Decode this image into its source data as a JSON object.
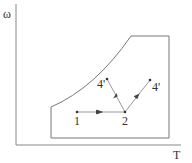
{
  "diagram": {
    "axes": {
      "y_label": "ω",
      "x_label": "T",
      "color": "#888888"
    },
    "region": {
      "description": "operating envelope",
      "color": "#777777"
    },
    "points": [
      {
        "id": "p1",
        "label": "1"
      },
      {
        "id": "p2",
        "label": "2"
      },
      {
        "id": "p4a",
        "label": "4'"
      },
      {
        "id": "p4b",
        "label": "4'"
      }
    ],
    "paths": [
      {
        "from": "1",
        "to": "2"
      },
      {
        "from": "2",
        "to": "4' (left)"
      },
      {
        "from": "2",
        "to": "4' (right)"
      }
    ],
    "line_color": "#999999",
    "point_color": "#333333"
  }
}
